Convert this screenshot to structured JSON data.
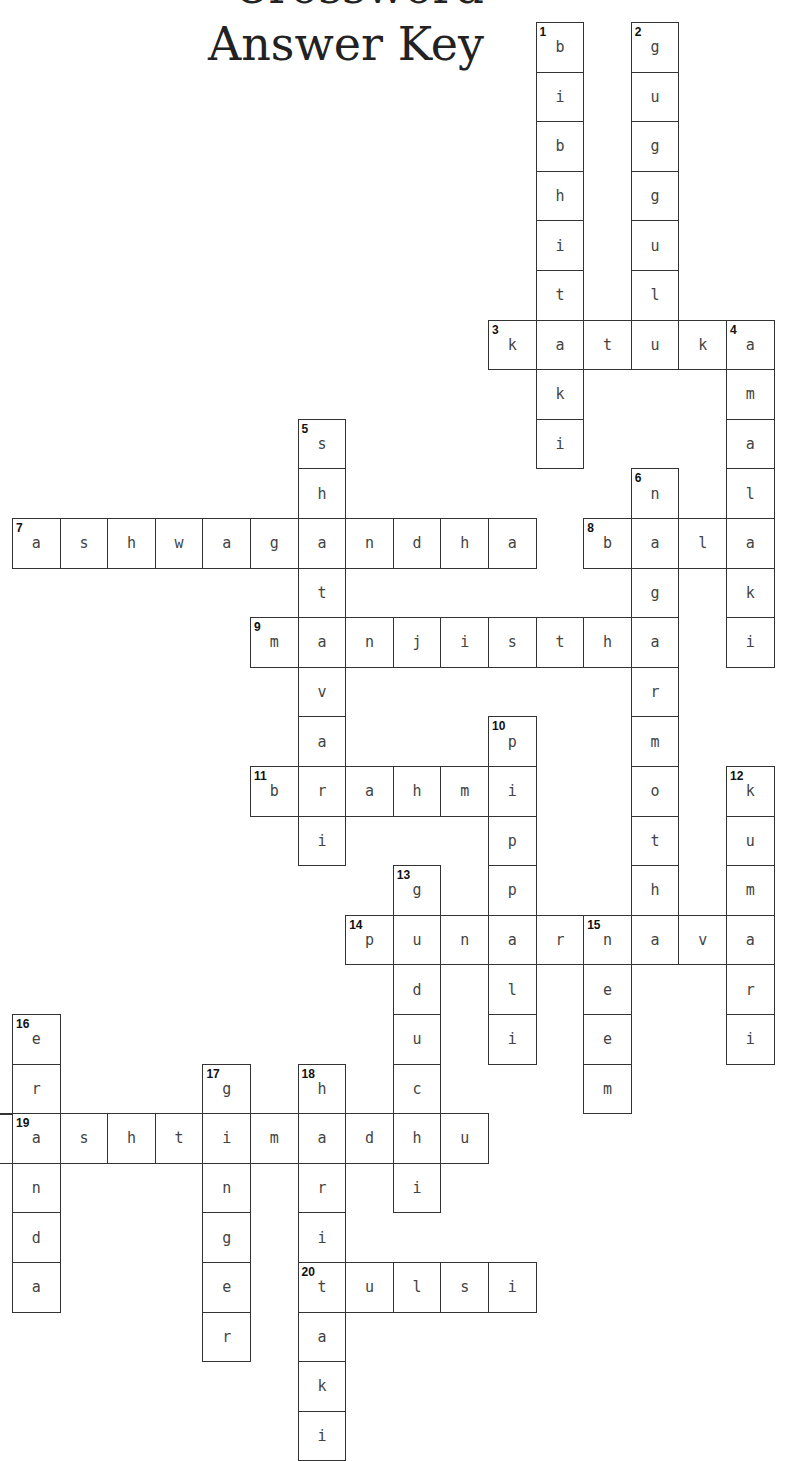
{
  "title": {
    "top_partial": "Crossword",
    "main": "Answer Key"
  },
  "grid": {
    "origin_x": 12,
    "origin_y": 22,
    "cell_w": 47.6,
    "cell_h": 49.6
  },
  "words": [
    {
      "num": "1",
      "dir": "down",
      "row": 0,
      "col": 11,
      "answer": "bibhitaki"
    },
    {
      "num": "2",
      "dir": "down",
      "row": 0,
      "col": 13,
      "answer": "guggulu"
    },
    {
      "num": "3",
      "dir": "across",
      "row": 6,
      "col": 10,
      "answer": "katuka"
    },
    {
      "num": "4",
      "dir": "down",
      "row": 6,
      "col": 15,
      "answer": "amalaki"
    },
    {
      "num": "5",
      "dir": "down",
      "row": 8,
      "col": 6,
      "answer": "shatavari"
    },
    {
      "num": "6",
      "dir": "down",
      "row": 9,
      "col": 13,
      "answer": "nagarmotha"
    },
    {
      "num": "7",
      "dir": "across",
      "row": 10,
      "col": 0,
      "answer": "ashwagandha"
    },
    {
      "num": "8",
      "dir": "across",
      "row": 10,
      "col": 12,
      "answer": "bala"
    },
    {
      "num": "9",
      "dir": "across",
      "row": 12,
      "col": 5,
      "answer": "manjistha"
    },
    {
      "num": "10",
      "dir": "down",
      "row": 14,
      "col": 10,
      "answer": "pippali"
    },
    {
      "num": "11",
      "dir": "across",
      "row": 15,
      "col": 5,
      "answer": "brahmi"
    },
    {
      "num": "12",
      "dir": "down",
      "row": 15,
      "col": 15,
      "answer": "kumari"
    },
    {
      "num": "13",
      "dir": "down",
      "row": 17,
      "col": 8,
      "answer": "guduchi"
    },
    {
      "num": "14",
      "dir": "across",
      "row": 18,
      "col": 7,
      "answer": "punarnava"
    },
    {
      "num": "15",
      "dir": "down",
      "row": 18,
      "col": 12,
      "answer": "neem"
    },
    {
      "num": "16",
      "dir": "down",
      "row": 20,
      "col": 0,
      "answer": "eranda"
    },
    {
      "num": "17",
      "dir": "down",
      "row": 21,
      "col": 4,
      "answer": "ginger"
    },
    {
      "num": "18",
      "dir": "down",
      "row": 21,
      "col": 6,
      "answer": "haritaki"
    },
    {
      "num": "19",
      "dir": "across",
      "row": 22,
      "col": 0,
      "answer": "ashtimadhu"
    },
    {
      "num": "20",
      "dir": "across",
      "row": 25,
      "col": 6,
      "answer": "tulsi"
    }
  ]
}
